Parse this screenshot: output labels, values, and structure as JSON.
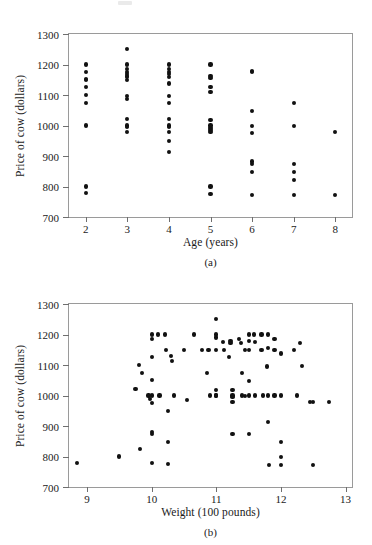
{
  "figure": {
    "panels": [
      {
        "id": "a",
        "caption": "(a)",
        "ylabel": "Price of cow (dollars)",
        "xlabel": "Age (years)"
      },
      {
        "id": "b",
        "caption": "(b)",
        "ylabel": "Price of cow (dollars)",
        "xlabel": "Weight (100 pounds)"
      }
    ]
  },
  "chart_data": [
    {
      "type": "scatter",
      "title": "",
      "panel": "(a)",
      "xlabel": "Age (years)",
      "ylabel": "Price of cow (dollars)",
      "xlim": [
        1.6,
        8.4
      ],
      "ylim": [
        700,
        1300
      ],
      "xticks": [
        2,
        3,
        4,
        5,
        6,
        7,
        8
      ],
      "xtick_labels": [
        "2",
        "3",
        "4",
        "5",
        "6",
        "7",
        "8"
      ],
      "yticks": [
        700,
        800,
        900,
        1000,
        1100,
        1200,
        1300
      ],
      "ytick_labels": [
        "700",
        "800",
        "900",
        "1000",
        "1100",
        "1200",
        "1300"
      ],
      "grid": false,
      "legend": false,
      "marker": "filled-circle",
      "marker_color": "#111111",
      "points": [
        [
          2,
          1200
        ],
        [
          2,
          1175
        ],
        [
          2,
          1152
        ],
        [
          2,
          1148
        ],
        [
          2,
          1125
        ],
        [
          2,
          1100
        ],
        [
          2,
          1075
        ],
        [
          2,
          1000
        ],
        [
          2,
          800
        ],
        [
          2,
          780
        ],
        [
          3,
          1250
        ],
        [
          3,
          1200
        ],
        [
          3,
          1185
        ],
        [
          3,
          1175
        ],
        [
          3,
          1170
        ],
        [
          3,
          1163
        ],
        [
          3,
          1158
        ],
        [
          3,
          1150
        ],
        [
          3,
          1098
        ],
        [
          3,
          1088
        ],
        [
          3,
          1022
        ],
        [
          3,
          1000
        ],
        [
          3,
          995
        ],
        [
          3,
          978
        ],
        [
          4,
          1200
        ],
        [
          4,
          1185
        ],
        [
          4,
          1175
        ],
        [
          4,
          1170
        ],
        [
          4,
          1160
        ],
        [
          4,
          1138
        ],
        [
          4,
          1097
        ],
        [
          4,
          1075
        ],
        [
          4,
          1022
        ],
        [
          4,
          1000
        ],
        [
          4,
          995
        ],
        [
          4,
          978
        ],
        [
          4,
          950
        ],
        [
          4,
          913
        ],
        [
          5,
          1200
        ],
        [
          5,
          1163
        ],
        [
          5,
          1155
        ],
        [
          5,
          1125
        ],
        [
          5,
          1110
        ],
        [
          5,
          1018
        ],
        [
          5,
          1000
        ],
        [
          5,
          992
        ],
        [
          5,
          985
        ],
        [
          5,
          978
        ],
        [
          5,
          800
        ],
        [
          5,
          775
        ],
        [
          6,
          1180
        ],
        [
          6,
          1175
        ],
        [
          6,
          1048
        ],
        [
          6,
          998
        ],
        [
          6,
          975
        ],
        [
          6,
          882
        ],
        [
          6,
          875
        ],
        [
          6,
          848
        ],
        [
          6,
          773
        ],
        [
          7,
          1075
        ],
        [
          7,
          998
        ],
        [
          7,
          873
        ],
        [
          7,
          848
        ],
        [
          7,
          822
        ],
        [
          7,
          773
        ],
        [
          8,
          978
        ],
        [
          8,
          773
        ]
      ]
    },
    {
      "type": "scatter",
      "title": "",
      "panel": "(b)",
      "xlabel": "Weight (100 pounds)",
      "ylabel": "Price of cow (dollars)",
      "xlim": [
        8.72,
        13.1
      ],
      "ylim": [
        700,
        1300
      ],
      "xticks": [
        9,
        10,
        11,
        12,
        13
      ],
      "xtick_labels": [
        "9",
        "10",
        "11",
        "12",
        "13"
      ],
      "yticks": [
        700,
        800,
        900,
        1000,
        1100,
        1200,
        1300
      ],
      "ytick_labels": [
        "700",
        "800",
        "900",
        "1000",
        "1100",
        "1200",
        "1300"
      ],
      "grid": false,
      "legend": false,
      "marker": "filled-circle",
      "marker_color": "#111111",
      "points": [
        [
          8.85,
          780
        ],
        [
          9.5,
          800
        ],
        [
          9.75,
          1022
        ],
        [
          9.8,
          1100
        ],
        [
          9.82,
          825
        ],
        [
          9.85,
          1075
        ],
        [
          9.95,
          1000
        ],
        [
          9.97,
          988
        ],
        [
          10.0,
          1200
        ],
        [
          10.0,
          1185
        ],
        [
          10.0,
          1125
        ],
        [
          10.0,
          1050
        ],
        [
          10.0,
          1000
        ],
        [
          10.0,
          975
        ],
        [
          10.0,
          880
        ],
        [
          10.0,
          873
        ],
        [
          10.0,
          778
        ],
        [
          10.1,
          1200
        ],
        [
          10.12,
          1000
        ],
        [
          10.2,
          1200
        ],
        [
          10.22,
          1148
        ],
        [
          10.25,
          950
        ],
        [
          10.25,
          848
        ],
        [
          10.25,
          775
        ],
        [
          10.3,
          1130
        ],
        [
          10.32,
          1113
        ],
        [
          10.35,
          1000
        ],
        [
          10.5,
          1148
        ],
        [
          10.55,
          985
        ],
        [
          10.65,
          1200
        ],
        [
          10.78,
          1148
        ],
        [
          10.85,
          1075
        ],
        [
          10.88,
          1148
        ],
        [
          10.9,
          1000
        ],
        [
          11.0,
          1250
        ],
        [
          11.0,
          1200
        ],
        [
          11.0,
          1190
        ],
        [
          11.0,
          1148
        ],
        [
          11.0,
          1018
        ],
        [
          11.0,
          1000
        ],
        [
          11.0,
          1000
        ],
        [
          11.1,
          1175
        ],
        [
          11.12,
          1148
        ],
        [
          11.2,
          1125
        ],
        [
          11.22,
          1180
        ],
        [
          11.22,
          1172
        ],
        [
          11.25,
          1018
        ],
        [
          11.25,
          1000
        ],
        [
          11.25,
          995
        ],
        [
          11.25,
          978
        ],
        [
          11.25,
          873
        ],
        [
          11.35,
          1185
        ],
        [
          11.38,
          1172
        ],
        [
          11.4,
          1075
        ],
        [
          11.4,
          1000
        ],
        [
          11.45,
          1148
        ],
        [
          11.45,
          998
        ],
        [
          11.5,
          1200
        ],
        [
          11.5,
          1180
        ],
        [
          11.5,
          1148
        ],
        [
          11.5,
          1048
        ],
        [
          11.5,
          1000
        ],
        [
          11.5,
          873
        ],
        [
          11.58,
          1200
        ],
        [
          11.6,
          1175
        ],
        [
          11.6,
          1000
        ],
        [
          11.7,
          1200
        ],
        [
          11.7,
          1148
        ],
        [
          11.72,
          1000
        ],
        [
          11.78,
          1095
        ],
        [
          11.8,
          1200
        ],
        [
          11.8,
          1155
        ],
        [
          11.8,
          1000
        ],
        [
          11.8,
          913
        ],
        [
          11.82,
          773
        ],
        [
          11.9,
          1185
        ],
        [
          11.9,
          1148
        ],
        [
          11.9,
          1000
        ],
        [
          12.0,
          1138
        ],
        [
          12.0,
          1000
        ],
        [
          12.0,
          848
        ],
        [
          12.0,
          798
        ],
        [
          12.0,
          773
        ],
        [
          12.2,
          1148
        ],
        [
          12.25,
          1000
        ],
        [
          12.3,
          1172
        ],
        [
          12.32,
          1098
        ],
        [
          12.45,
          978
        ],
        [
          12.5,
          978
        ],
        [
          12.5,
          773
        ],
        [
          12.75,
          978
        ]
      ]
    }
  ]
}
